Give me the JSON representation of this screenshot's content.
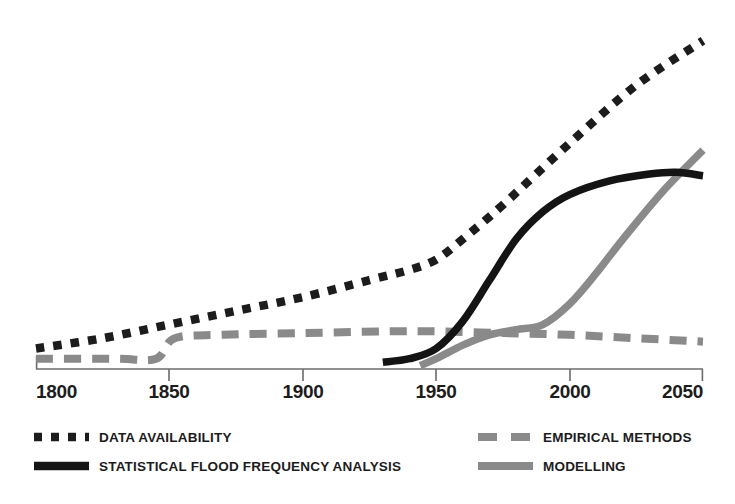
{
  "chart_data": {
    "type": "line",
    "title": "",
    "subtitle": "",
    "xlabel": "",
    "ylabel": "",
    "xlim": [
      1800,
      2050
    ],
    "ylim": [
      0,
      100
    ],
    "grid": false,
    "legend_position": "bottom",
    "x_ticks": [
      "1800",
      "1850",
      "1900",
      "1950",
      "2000",
      "2050"
    ],
    "x_tick_values": [
      1800,
      1850,
      1900,
      1950,
      2000,
      2050
    ],
    "y_ticks": [],
    "series": [
      {
        "name": "DATA AVAILABILITY",
        "style": "dotted",
        "color": "#1c1c1c",
        "x": [
          1800,
          1825,
          1850,
          1875,
          1900,
          1925,
          1940,
          1950,
          1960,
          1975,
          2000,
          2025,
          2050
        ],
        "values": [
          6,
          9,
          13,
          17,
          21,
          26,
          29,
          32,
          38,
          48,
          66,
          83,
          96
        ]
      },
      {
        "name": "EMPIRICAL METHODS",
        "style": "dashed",
        "color": "#8a8a8a",
        "x": [
          1800,
          1830,
          1845,
          1852,
          1870,
          1900,
          1930,
          1950,
          1975,
          2000,
          2025,
          2050
        ],
        "values": [
          3,
          3,
          3,
          9,
          10,
          10.5,
          11,
          11,
          10.5,
          10,
          9,
          8
        ]
      },
      {
        "name": "STATISTICAL FLOOD FREQUENCY ANALYSIS",
        "style": "solid",
        "color": "#141414",
        "x": [
          1930,
          1940,
          1950,
          1960,
          1970,
          1980,
          1990,
          2000,
          2015,
          2030,
          2040,
          2050
        ],
        "values": [
          2,
          3,
          6,
          14,
          26,
          38,
          46,
          51,
          55,
          57,
          57.5,
          56.5
        ]
      },
      {
        "name": "MODELLING",
        "style": "solid",
        "color": "#8a8a8a",
        "x": [
          1944,
          1950,
          1960,
          1970,
          1980,
          1990,
          2000,
          2010,
          2020,
          2035,
          2050
        ],
        "values": [
          1,
          3,
          7,
          10,
          11.5,
          13,
          19,
          28,
          38,
          52,
          64
        ]
      }
    ],
    "annotations": []
  },
  "axis": {
    "ticks": [
      {
        "label": "1800",
        "value": 1800
      },
      {
        "label": "1850",
        "value": 1850
      },
      {
        "label": "1900",
        "value": 1900
      },
      {
        "label": "1950",
        "value": 1950
      },
      {
        "label": "2000",
        "value": 2000
      },
      {
        "label": "2050",
        "value": 2050
      }
    ],
    "line_color": "#6b6b6b"
  },
  "legend": {
    "left_column": [
      {
        "label": "DATA AVAILABILITY",
        "style": "dotted",
        "color": "#1c1c1c"
      },
      {
        "label": "STATISTICAL FLOOD FREQUENCY ANALYSIS",
        "style": "solid",
        "color": "#141414"
      }
    ],
    "right_column": [
      {
        "label": "EMPIRICAL METHODS",
        "style": "dashed",
        "color": "#8a8a8a"
      },
      {
        "label": "MODELLING",
        "style": "solid",
        "color": "#8a8a8a"
      }
    ]
  },
  "colors": {
    "black": "#1c1c1c",
    "gray": "#8a8a8a",
    "axis": "#6b6b6b",
    "background": "#ffffff"
  }
}
